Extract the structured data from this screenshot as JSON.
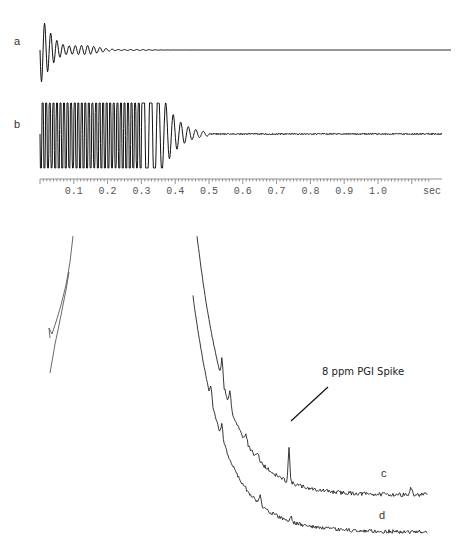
{
  "chart_data": [
    {
      "type": "line",
      "title": "",
      "panel": "FID traces",
      "xlabel": "sec",
      "ylabel": "",
      "xlim": [
        0,
        1.15
      ],
      "x_ticks": [
        "0.1",
        "0.2",
        "0.3",
        "0.4",
        "0.5",
        "0.6",
        "0.7",
        "0.8",
        "0.9",
        "1.0"
      ],
      "x_unit_label": "sec",
      "grid": false,
      "series": [
        {
          "name": "a",
          "description": "decaying free induction decay, mostly damped by ~0.25 s"
        },
        {
          "name": "b",
          "description": "saturated/clipped FID to ~0.35 s, decaying to baseline by ~0.5 s"
        }
      ]
    },
    {
      "type": "line",
      "title": "",
      "panel": "Spectra (baseline region)",
      "xlabel": "",
      "ylabel": "",
      "grid": false,
      "series": [
        {
          "name": "c",
          "description": "spectrum with spike"
        },
        {
          "name": "d",
          "description": "spectrum without spike"
        }
      ],
      "annotations": [
        {
          "text": "8 ppm PGI Spike",
          "points_to": "peak on trace c"
        }
      ]
    }
  ],
  "labels": {
    "a": "a",
    "b": "b",
    "c": "c",
    "d": "d",
    "unit": "sec",
    "annotation": "8 ppm PGI Spike"
  },
  "ticks": [
    "0.1",
    "0.2",
    "0.3",
    "0.4",
    "0.5",
    "0.6",
    "0.7",
    "0.8",
    "0.9",
    "1.0"
  ]
}
